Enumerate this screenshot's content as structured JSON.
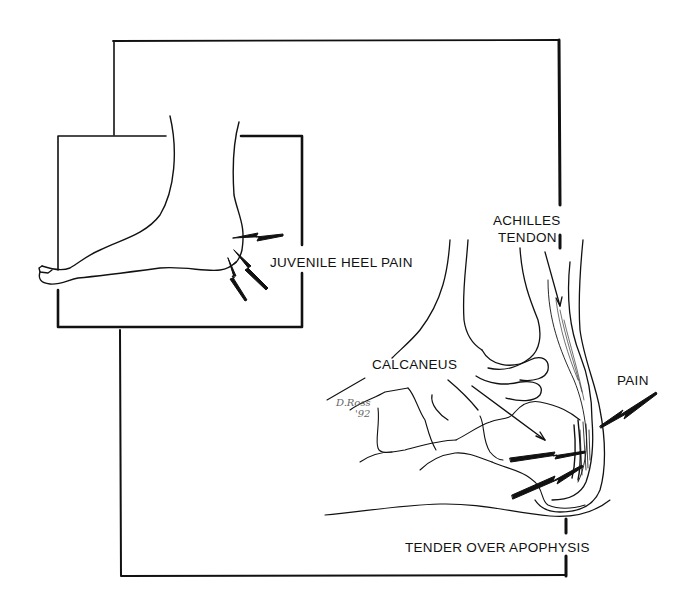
{
  "figure": {
    "type": "medical line illustration",
    "colors": {
      "ink": "#111111",
      "background": "#ffffff"
    }
  },
  "labels": {
    "juvenile_heel_pain": "JUVENILE HEEL PAIN",
    "achilles_line1": "ACHILLES",
    "achilles_line2": "TENDON",
    "calcaneus": "CALCANEUS",
    "pain": "PAIN",
    "tender_over_apophysis": "TENDER OVER APOPHYSIS"
  },
  "signature": {
    "name": "D.Ross",
    "year": "'92"
  }
}
